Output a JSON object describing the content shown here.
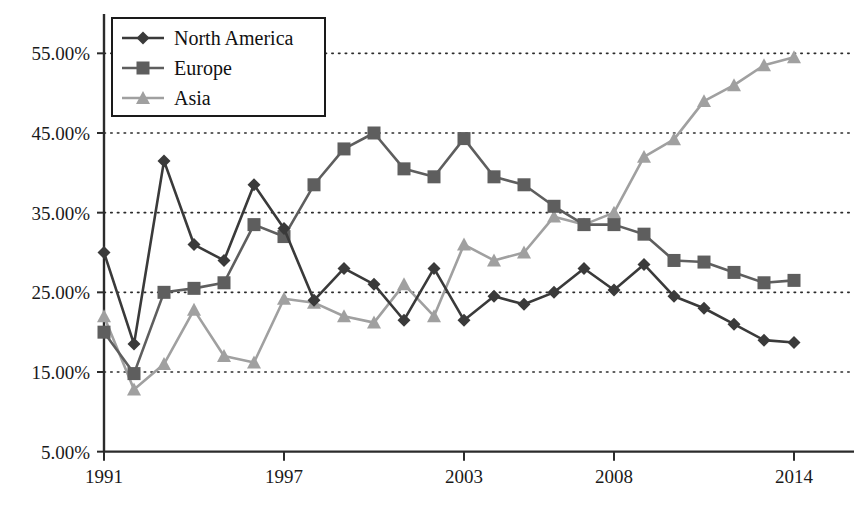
{
  "chart_data": {
    "type": "line",
    "title": "",
    "xlabel": "",
    "ylabel": "",
    "x": [
      1991,
      1992,
      1993,
      1994,
      1995,
      1996,
      1997,
      1998,
      1999,
      2000,
      2001,
      2002,
      2003,
      2004,
      2005,
      2006,
      2007,
      2008,
      2009,
      2010,
      2011,
      2012,
      2013,
      2014
    ],
    "xlim": [
      1991,
      2014
    ],
    "ylim": [
      5,
      55
    ],
    "yticks": [
      5,
      15,
      25,
      35,
      45,
      55
    ],
    "ytick_labels": [
      "5.00%",
      "15.00%",
      "25.00%",
      "35.00%",
      "45.00%",
      "55.00%"
    ],
    "xticks": [
      1991,
      1997,
      2003,
      2008,
      2014
    ],
    "xtick_labels": [
      "1991",
      "1997",
      "2003",
      "2008",
      "2014"
    ],
    "grid": true,
    "grid_axis": "y",
    "legend_position": "top-left",
    "series": [
      {
        "name": "North America",
        "marker": "diamond",
        "color": "#3a3a3a",
        "values": [
          30.0,
          18.5,
          41.5,
          31.0,
          29.0,
          38.5,
          33.0,
          24.0,
          28.0,
          26.0,
          21.5,
          28.0,
          21.5,
          24.5,
          23.5,
          25.0,
          28.0,
          25.3,
          28.5,
          24.5,
          23.0,
          21.0,
          19.0,
          18.7
        ]
      },
      {
        "name": "Europe",
        "marker": "square",
        "color": "#5e5e5e",
        "values": [
          20.0,
          14.8,
          25.0,
          25.5,
          26.2,
          33.5,
          32.0,
          38.5,
          43.0,
          45.0,
          40.5,
          39.5,
          44.3,
          39.5,
          38.5,
          35.8,
          33.5,
          33.5,
          32.3,
          29.0,
          28.8,
          27.5,
          26.2,
          26.5
        ]
      },
      {
        "name": "Asia",
        "marker": "triangle",
        "color": "#a0a0a0",
        "values": [
          22.0,
          12.8,
          16.0,
          22.8,
          17.0,
          16.2,
          24.2,
          23.7,
          22.0,
          21.2,
          26.0,
          22.0,
          31.0,
          29.0,
          30.0,
          34.5,
          33.5,
          35.0,
          42.0,
          44.2,
          49.0,
          51.0,
          53.5,
          54.5
        ]
      }
    ]
  },
  "legend": {
    "items": [
      {
        "label": "North America"
      },
      {
        "label": "Europe"
      },
      {
        "label": "Asia"
      }
    ]
  }
}
